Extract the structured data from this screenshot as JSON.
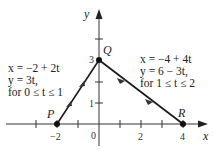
{
  "diagram": {
    "axes": {
      "x_label": "x",
      "y_label": "y",
      "x_ticks": [
        "−2",
        "0",
        "2",
        "4"
      ],
      "y_ticks": [
        "1",
        "3"
      ]
    },
    "points": {
      "P": {
        "label": "P",
        "x": -2,
        "y": 0
      },
      "Q": {
        "label": "Q",
        "x": 0,
        "y": 3
      },
      "R": {
        "label": "R",
        "x": 4,
        "y": 0
      }
    },
    "segment_left": {
      "line1": "x = −2 + 2t",
      "line2": "y = 3t,",
      "line3": "for 0 ≤ t ≤ 1"
    },
    "segment_right": {
      "line1": "x = −4 + 4t",
      "line2": "y = 6 − 3t,",
      "line3": "for 1 ≤ t ≤ 2"
    },
    "colors": {
      "line": "#1a1a1a",
      "axis": "#333333",
      "text": "#222222"
    }
  }
}
